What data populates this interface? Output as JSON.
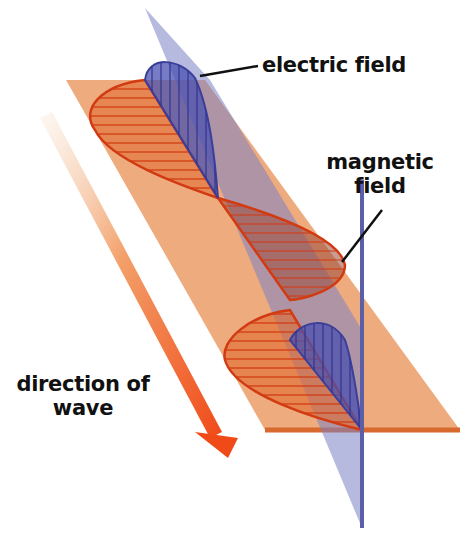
{
  "figure": {
    "labels": {
      "electric_field": "electric field",
      "magnetic_field_line1": "magnetic",
      "magnetic_field_line2": "field",
      "direction_line1": "direction of",
      "direction_line2": "wave"
    },
    "colors": {
      "background": "#ffffff",
      "magnetic_plane": "#e8935a",
      "magnetic_wave_stroke": "#d23a12",
      "magnetic_wave_fill": "#e06a30",
      "electric_plane": "#8a8fc8",
      "electric_wave_stroke": "#3a3f9a",
      "electric_wave_fill": "#4a50b0",
      "arrow_start": "#f4d9c0",
      "arrow_end": "#f04a18",
      "text": "#111111",
      "leader_line": "#111111"
    },
    "geometry": {
      "magnetic_plane": "66,80 205,80 460,430 265,430",
      "magnetic_plane_edge": "265,430 460,430",
      "electric_plane": "145,8 210,80 362,330 362,528",
      "electric_plane_edge": "362,180 362,528",
      "electric_wave_1": "M145,80 C148,55 180,58 195,78 C210,110 215,160 218,198 L145,80 Z",
      "electric_wave_2": "M290,340 C300,320 330,315 345,340 C355,370 360,420 362,430 Z",
      "magnetic_wave_1": "M145,80 C100,85 80,110 95,130 C110,160 180,185 218,198 Z",
      "magnetic_wave_2": "M218,198 C260,210 340,235 345,265 C345,290 300,300 290,300 Z",
      "magnetic_wave_3": "M290,310 C250,315 220,340 225,360 C235,395 320,420 362,430 Z",
      "arrow_shaft": "40,118 52,112 222,432 210,438",
      "arrow_head": "195,432 238,438 228,458",
      "leader_electric": "200,76 258,66",
      "leader_magnetic": "342,262 382,210"
    },
    "label_positions": {
      "electric_field": {
        "left": 262,
        "top": 53
      },
      "magnetic_field": {
        "left": 325,
        "top": 150
      },
      "direction": {
        "left": 8,
        "top": 372
      }
    }
  }
}
